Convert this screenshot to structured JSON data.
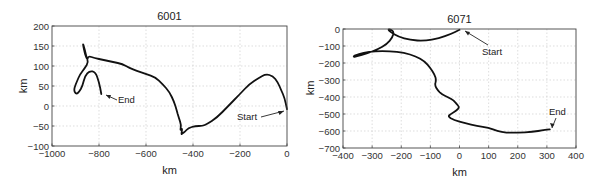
{
  "chart_data": [
    {
      "type": "line",
      "title": "6001",
      "xlabel": "km",
      "ylabel": "km",
      "xlim": [
        -1000,
        0
      ],
      "ylim": [
        -100,
        200
      ],
      "xticks": [
        -1000,
        -800,
        -600,
        -400,
        -200,
        0
      ],
      "yticks": [
        -100,
        -50,
        0,
        50,
        100,
        150,
        200
      ],
      "xtick_labels": [
        "−1000",
        "−800",
        "−600",
        "−400",
        "−200",
        "0"
      ],
      "ytick_labels": [
        "−100",
        "−50",
        "0",
        "50",
        "100",
        "150",
        "200"
      ],
      "grid": true,
      "annotations": [
        {
          "text": "Start",
          "x": 0,
          "y": -10
        },
        {
          "text": "End",
          "x": -790,
          "y": 30
        }
      ],
      "series": [
        {
          "name": "track 6001",
          "x": [
            0,
            -10,
            -25,
            -40,
            -60,
            -90,
            -120,
            -160,
            -200,
            -250,
            -300,
            -340,
            -360,
            -390,
            -420,
            -435,
            -445,
            -450,
            -445,
            -455,
            -450,
            -460,
            -470,
            -480,
            -500,
            -530,
            -560,
            -600,
            -640,
            -670,
            -700,
            -740,
            -780,
            -820,
            -845,
            -850,
            -860,
            -870,
            -860,
            -855,
            -845,
            -860,
            -880,
            -895,
            -905,
            -905,
            -895,
            -885,
            -870,
            -860,
            -840,
            -815,
            -800,
            -790
          ],
          "y": [
            -8,
            20,
            40,
            60,
            75,
            80,
            70,
            55,
            30,
            0,
            -30,
            -45,
            -50,
            -50,
            -55,
            -65,
            -68,
            -72,
            -55,
            -62,
            -48,
            -30,
            -10,
            10,
            35,
            55,
            72,
            80,
            88,
            95,
            105,
            110,
            115,
            120,
            125,
            115,
            130,
            160,
            140,
            125,
            110,
            95,
            80,
            60,
            45,
            35,
            30,
            35,
            50,
            75,
            88,
            85,
            60,
            30
          ]
        }
      ]
    },
    {
      "type": "line",
      "title": "6071",
      "xlabel": "km",
      "ylabel": "km",
      "xlim": [
        -400,
        400
      ],
      "ylim": [
        -700,
        0
      ],
      "xticks": [
        -400,
        -300,
        -200,
        -100,
        0,
        100,
        200,
        300,
        400
      ],
      "yticks": [
        -700,
        -600,
        -500,
        -400,
        -300,
        -200,
        -100,
        0
      ],
      "xtick_labels": [
        "−400",
        "−300",
        "−200",
        "−100",
        "0",
        "100",
        "200",
        "300",
        "400"
      ],
      "ytick_labels": [
        "−700",
        "−600",
        "−500",
        "−400",
        "−300",
        "−200",
        "−100",
        "0"
      ],
      "grid": true,
      "annotations": [
        {
          "text": "Start",
          "x": 70,
          "y": -130
        },
        {
          "text": "End",
          "x": 300,
          "y": -490
        }
      ],
      "series": [
        {
          "name": "track 6071",
          "x": [
            0,
            -30,
            -70,
            -120,
            -170,
            -210,
            -235,
            -245,
            -240,
            -225,
            -230,
            -250,
            -280,
            -320,
            -350,
            -365,
            -360,
            -330,
            -290,
            -240,
            -190,
            -150,
            -120,
            -100,
            -85,
            -80,
            -85,
            -75,
            -60,
            -40,
            -20,
            -10,
            0,
            -10,
            -30,
            -40,
            -20,
            20,
            60,
            100,
            130,
            160,
            200,
            250,
            290,
            310
          ],
          "y": [
            -5,
            -30,
            -55,
            -70,
            -65,
            -45,
            -20,
            -5,
            0,
            -15,
            -50,
            -90,
            -120,
            -145,
            -160,
            -165,
            -155,
            -140,
            -130,
            -130,
            -140,
            -160,
            -190,
            -230,
            -270,
            -300,
            -330,
            -360,
            -385,
            -400,
            -420,
            -440,
            -460,
            -480,
            -500,
            -515,
            -535,
            -555,
            -570,
            -580,
            -600,
            -610,
            -610,
            -605,
            -595,
            -590
          ]
        }
      ]
    }
  ]
}
